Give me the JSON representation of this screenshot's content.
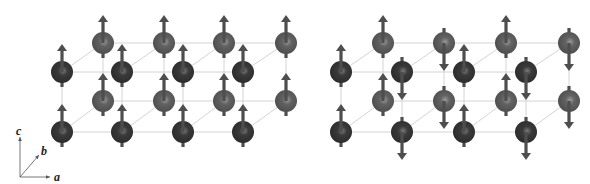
{
  "figure": {
    "colors": {
      "background": "#ffffff",
      "front_sphere": "#333333",
      "back_sphere": "#5c5c5c",
      "sphere_highlight": "#8a8a8a",
      "arrow": "#4e4e4e",
      "bond": "#d4d4d4",
      "axis": "#555555"
    },
    "sphere_radius": 11,
    "arrow": {
      "length_above": 28,
      "tail_below": 15,
      "shaft_width": 3.2,
      "head_width": 10,
      "head_length": 7
    }
  },
  "axes": {
    "origin": [
      20,
      177
    ],
    "c": {
      "label": "c",
      "end": [
        20,
        137
      ],
      "label_pos": [
        16,
        125
      ]
    },
    "b": {
      "label": "b",
      "end": [
        39,
        155
      ],
      "label_pos": [
        41,
        145
      ]
    },
    "a": {
      "label": "a",
      "end": [
        50,
        177
      ],
      "label_pos": [
        54,
        171
      ]
    }
  },
  "panels": [
    {
      "name": "ferromagnetic-panel",
      "front_cols": [
        62,
        122,
        183,
        243
      ],
      "back_cols": [
        103,
        164,
        224,
        286
      ],
      "front_rows": [
        72,
        132
      ],
      "back_rows": [
        43,
        101
      ],
      "front_spins": [
        [
          "up",
          "up"
        ],
        [
          "up",
          "up"
        ],
        [
          "up",
          "up"
        ],
        [
          "up",
          "up"
        ]
      ],
      "back_spins": [
        [
          "up",
          "up"
        ],
        [
          "up",
          "up"
        ],
        [
          "up",
          "up"
        ],
        [
          "up",
          "up"
        ]
      ]
    },
    {
      "name": "antiferromagnetic-panel",
      "front_cols": [
        341,
        402,
        464,
        526
      ],
      "back_cols": [
        383,
        444,
        506,
        569
      ],
      "front_rows": [
        72,
        132
      ],
      "back_rows": [
        43,
        101
      ],
      "front_spins": [
        [
          "up",
          "up"
        ],
        [
          "down",
          "down"
        ],
        [
          "up",
          "up"
        ],
        [
          "down",
          "down"
        ]
      ],
      "back_spins": [
        [
          "up",
          "up"
        ],
        [
          "down",
          "down"
        ],
        [
          "up",
          "up"
        ],
        [
          "down",
          "down"
        ]
      ]
    }
  ]
}
